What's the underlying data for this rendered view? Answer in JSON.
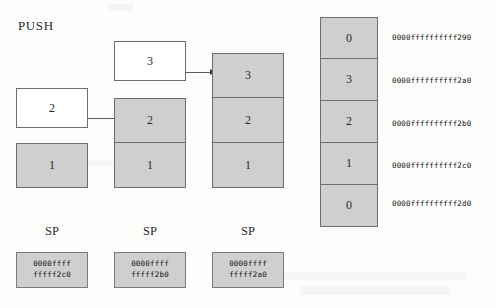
{
  "figure": {
    "title": "PUSH"
  },
  "incoming_values": [
    {
      "value": "2"
    },
    {
      "value": "3"
    }
  ],
  "stacks": [
    {
      "name": "stack-step-1",
      "cells": [
        {
          "value": "1"
        }
      ]
    },
    {
      "name": "stack-step-2",
      "cells": [
        {
          "value": "2"
        },
        {
          "value": "1"
        }
      ]
    },
    {
      "name": "stack-step-3",
      "cells": [
        {
          "value": "3"
        },
        {
          "value": "2"
        },
        {
          "value": "1"
        }
      ]
    }
  ],
  "memory": {
    "cells": [
      {
        "value": "0",
        "address": "0000ffffffffff290"
      },
      {
        "value": "3",
        "address": "0000ffffffffff2a0"
      },
      {
        "value": "2",
        "address": "0000ffffffffff2b0"
      },
      {
        "value": "1",
        "address": "0000ffffffffff2c0"
      },
      {
        "value": "0",
        "address": "0000ffffffffff2d0"
      }
    ]
  },
  "stack_pointers": [
    {
      "label": "SP",
      "line1": "0000ffff",
      "line2": "fffff2c0"
    },
    {
      "label": "SP",
      "line1": "0000ffff",
      "line2": "fffff2b0"
    },
    {
      "label": "SP",
      "line1": "0000ffff",
      "line2": "fffff2a0"
    }
  ],
  "colors": {
    "cell_fill": "#cfcfcf",
    "cell_border": "#6e6e6e",
    "arrow": "#3d3d3d",
    "text": "#1d1d1d",
    "page": "#fdfdfc"
  }
}
